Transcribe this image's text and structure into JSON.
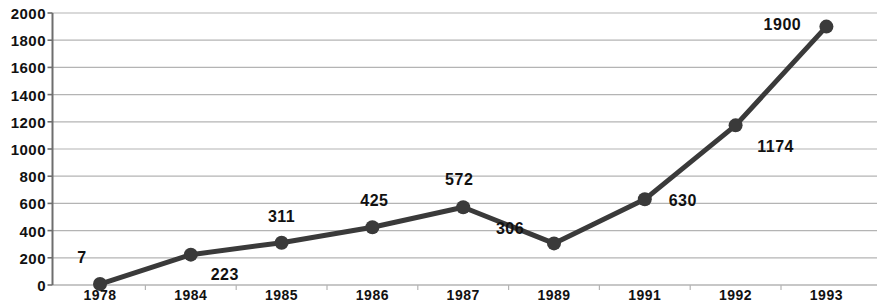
{
  "chart_data": {
    "type": "line",
    "title": "",
    "subtitle": "",
    "xlabel": "",
    "ylabel": "",
    "categories": [
      "1978",
      "1984",
      "1985",
      "1986",
      "1987",
      "1989",
      "1991",
      "1992",
      "1993"
    ],
    "values": [
      7,
      223,
      311,
      425,
      572,
      306,
      630,
      1174,
      1900
    ],
    "point_labels": [
      "7",
      "223",
      "311",
      "425",
      "572",
      "306",
      "630",
      "1174",
      "1900"
    ],
    "ylim": [
      0,
      2000
    ],
    "ytick_labels": [
      "2000",
      "1800",
      "1600",
      "1400",
      "1200",
      "1000",
      "800",
      "600",
      "400",
      "200",
      "0"
    ],
    "ytick_values": [
      2000,
      1800,
      1600,
      1400,
      1200,
      1000,
      800,
      600,
      400,
      200,
      0
    ],
    "ytick_step": 200,
    "grid": true,
    "grid_axis": "y",
    "legend": false,
    "legend_position": "none",
    "series": [
      {
        "name": "",
        "values": [
          7,
          223,
          311,
          425,
          572,
          306,
          630,
          1174,
          1900
        ]
      }
    ],
    "label_offsets": [
      {
        "dx": -18,
        "dy": -26
      },
      {
        "dx": 34,
        "dy": 20
      },
      {
        "dx": 0,
        "dy": -26
      },
      {
        "dx": 2,
        "dy": -26
      },
      {
        "dx": -4,
        "dy": -27
      },
      {
        "dx": -44,
        "dy": -14
      },
      {
        "dx": 38,
        "dy": 2
      },
      {
        "dx": 40,
        "dy": 22
      },
      {
        "dx": -44,
        "dy": -2
      }
    ],
    "colors": {
      "line": "#3a3a3a",
      "marker": "#3a3a3a",
      "grid": "#b4b4b4",
      "axis": "#6e6e6e",
      "text": "#111111",
      "background": "#ffffff"
    },
    "style": {
      "line_width": 5,
      "marker_radius": 7,
      "marker_shape": "circle"
    }
  }
}
